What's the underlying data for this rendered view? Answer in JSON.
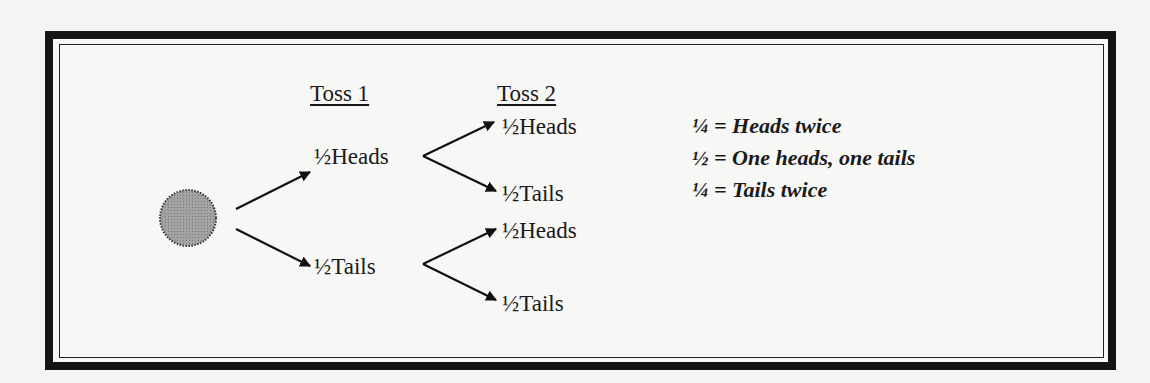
{
  "diagram": {
    "start_node": "coin",
    "headers": {
      "toss1": "Toss 1",
      "toss2": "Toss 2"
    },
    "toss1": [
      {
        "fraction": "½",
        "label": "Heads"
      },
      {
        "fraction": "½",
        "label": "Tails"
      }
    ],
    "toss2": [
      {
        "fraction": "½",
        "label": "Heads"
      },
      {
        "fraction": "½",
        "label": "Tails"
      },
      {
        "fraction": "½",
        "label": "Heads"
      },
      {
        "fraction": "½",
        "label": "Tails"
      }
    ],
    "summary": [
      {
        "fraction": "¼",
        "text": "= Heads twice"
      },
      {
        "fraction": "½",
        "text": "= One heads, one tails"
      },
      {
        "fraction": "¼",
        "text": "= Tails twice"
      }
    ],
    "colors": {
      "coin_fill": "#9a9a9a",
      "line": "#111111",
      "border": "#141414"
    }
  }
}
